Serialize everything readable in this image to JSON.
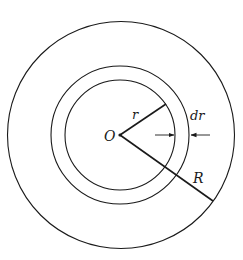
{
  "diagram": {
    "center_label": "O",
    "inner_radius_label": "r",
    "ring_width_label": "dr",
    "outer_radius_label": "R",
    "colors": {
      "stroke": "#1a1a1a",
      "background": "#ffffff"
    }
  }
}
